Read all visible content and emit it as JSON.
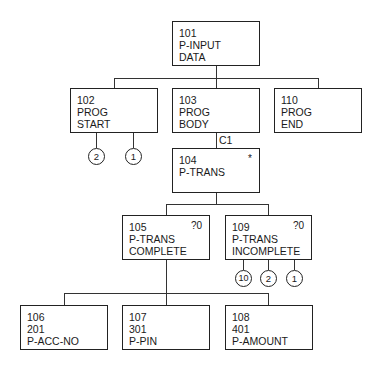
{
  "diagram": {
    "type": "structure-chart",
    "nodes": [
      {
        "id": "101",
        "lines": [
          "101",
          "P-INPUT",
          "DATA"
        ],
        "flag": ""
      },
      {
        "id": "102",
        "lines": [
          "102",
          "PROG",
          "START"
        ],
        "flag": ""
      },
      {
        "id": "103",
        "lines": [
          "103",
          "PROG",
          "BODY"
        ],
        "flag": ""
      },
      {
        "id": "110",
        "lines": [
          "110",
          "PROG",
          "END"
        ],
        "flag": ""
      },
      {
        "id": "104",
        "lines": [
          "104",
          "P-TRANS"
        ],
        "flag": "*"
      },
      {
        "id": "105",
        "lines": [
          "105",
          "P-TRANS",
          "COMPLETE"
        ],
        "flag": "?0"
      },
      {
        "id": "109",
        "lines": [
          "109",
          "P-TRANS",
          "INCOMPLETE"
        ],
        "flag": "?0"
      },
      {
        "id": "106",
        "lines": [
          "106",
          "201",
          "P-ACC-NO"
        ],
        "flag": ""
      },
      {
        "id": "107",
        "lines": [
          "107",
          "301",
          "P-PIN"
        ],
        "flag": ""
      },
      {
        "id": "108",
        "lines": [
          "108",
          "401",
          "P-AMOUNT"
        ],
        "flag": ""
      }
    ],
    "edges": [
      {
        "from": "101",
        "to": "102"
      },
      {
        "from": "101",
        "to": "103"
      },
      {
        "from": "101",
        "to": "110"
      },
      {
        "from": "103",
        "to": "104",
        "label": "C1"
      },
      {
        "from": "104",
        "to": "105"
      },
      {
        "from": "104",
        "to": "109"
      },
      {
        "from": "105",
        "to": "106"
      },
      {
        "from": "105",
        "to": "107"
      },
      {
        "from": "105",
        "to": "108"
      }
    ],
    "condition_label": "C1",
    "operations": {
      "102": [
        "2",
        "1"
      ],
      "109": [
        "10",
        "2",
        "1"
      ]
    }
  }
}
